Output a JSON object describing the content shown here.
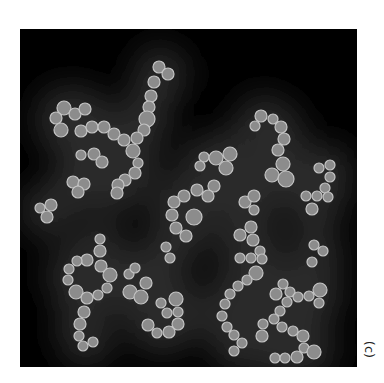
{
  "figure": {
    "panel_label": "(c)",
    "colors": {
      "background": "#000000",
      "haze": "#2a2a2a",
      "particle_fill": "#8c8c8c",
      "particle_rim": "#c4c4c4",
      "page": "#ffffff"
    },
    "panel": {
      "x": 20,
      "y": 29,
      "width": 337,
      "height": 338
    },
    "particles": [
      [
        159,
        67,
        6
      ],
      [
        168,
        74,
        6
      ],
      [
        154,
        82,
        6
      ],
      [
        151,
        96,
        6
      ],
      [
        149,
        107,
        6
      ],
      [
        147,
        119,
        8
      ],
      [
        144,
        130,
        6
      ],
      [
        64,
        108,
        7
      ],
      [
        56,
        118,
        6
      ],
      [
        61,
        130,
        7
      ],
      [
        75,
        114,
        6
      ],
      [
        85,
        109,
        6
      ],
      [
        81,
        131,
        6
      ],
      [
        92,
        127,
        6
      ],
      [
        104,
        127,
        6
      ],
      [
        114,
        134,
        6
      ],
      [
        124,
        140,
        6
      ],
      [
        137,
        138,
        6
      ],
      [
        133,
        151,
        7
      ],
      [
        138,
        163,
        5
      ],
      [
        135,
        173,
        6
      ],
      [
        125,
        180,
        6
      ],
      [
        118,
        185,
        6
      ],
      [
        117,
        193,
        6
      ],
      [
        81,
        155,
        5
      ],
      [
        94,
        154,
        6
      ],
      [
        102,
        162,
        6
      ],
      [
        73,
        182,
        6
      ],
      [
        84,
        184,
        6
      ],
      [
        78,
        192,
        6
      ],
      [
        40,
        208,
        5
      ],
      [
        51,
        205,
        6
      ],
      [
        47,
        217,
        6
      ],
      [
        204,
        157,
        5
      ],
      [
        200,
        166,
        5
      ],
      [
        216,
        158,
        7
      ],
      [
        230,
        154,
        7
      ],
      [
        226,
        168,
        7
      ],
      [
        214,
        186,
        6
      ],
      [
        208,
        196,
        6
      ],
      [
        197,
        190,
        6
      ],
      [
        184,
        196,
        6
      ],
      [
        174,
        202,
        6
      ],
      [
        172,
        215,
        6
      ],
      [
        176,
        228,
        6
      ],
      [
        186,
        236,
        6
      ],
      [
        194,
        217,
        8
      ],
      [
        245,
        202,
        6
      ],
      [
        254,
        196,
        6
      ],
      [
        254,
        210,
        5
      ],
      [
        261,
        116,
        6
      ],
      [
        255,
        126,
        5
      ],
      [
        273,
        119,
        5
      ],
      [
        281,
        127,
        6
      ],
      [
        284,
        139,
        6
      ],
      [
        278,
        150,
        6
      ],
      [
        283,
        164,
        7
      ],
      [
        272,
        175,
        7
      ],
      [
        286,
        179,
        8
      ],
      [
        319,
        168,
        5
      ],
      [
        330,
        165,
        5
      ],
      [
        330,
        177,
        5
      ],
      [
        325,
        188,
        5
      ],
      [
        317,
        196,
        5
      ],
      [
        306,
        196,
        5
      ],
      [
        328,
        197,
        5
      ],
      [
        312,
        209,
        6
      ],
      [
        314,
        245,
        5
      ],
      [
        323,
        251,
        5
      ],
      [
        100,
        239,
        5
      ],
      [
        100,
        251,
        6
      ],
      [
        87,
        260,
        6
      ],
      [
        77,
        261,
        5
      ],
      [
        69,
        269,
        5
      ],
      [
        101,
        266,
        6
      ],
      [
        110,
        275,
        7
      ],
      [
        68,
        280,
        5
      ],
      [
        76,
        292,
        7
      ],
      [
        87,
        298,
        6
      ],
      [
        98,
        295,
        5
      ],
      [
        107,
        288,
        5
      ],
      [
        84,
        312,
        6
      ],
      [
        80,
        324,
        6
      ],
      [
        79,
        336,
        5
      ],
      [
        83,
        346,
        5
      ],
      [
        93,
        342,
        5
      ],
      [
        129,
        274,
        5
      ],
      [
        135,
        268,
        5
      ],
      [
        146,
        283,
        6
      ],
      [
        130,
        292,
        7
      ],
      [
        141,
        297,
        7
      ],
      [
        166,
        247,
        5
      ],
      [
        170,
        258,
        5
      ],
      [
        161,
        303,
        5
      ],
      [
        167,
        313,
        5
      ],
      [
        176,
        299,
        7
      ],
      [
        178,
        312,
        5
      ],
      [
        178,
        324,
        6
      ],
      [
        169,
        332,
        6
      ],
      [
        157,
        333,
        5
      ],
      [
        148,
        325,
        6
      ],
      [
        251,
        227,
        6
      ],
      [
        240,
        235,
        6
      ],
      [
        253,
        240,
        6
      ],
      [
        260,
        251,
        5
      ],
      [
        240,
        258,
        5
      ],
      [
        251,
        258,
        5
      ],
      [
        262,
        259,
        5
      ],
      [
        256,
        273,
        7
      ],
      [
        247,
        280,
        5
      ],
      [
        238,
        286,
        5
      ],
      [
        230,
        294,
        5
      ],
      [
        225,
        304,
        5
      ],
      [
        222,
        316,
        5
      ],
      [
        227,
        327,
        5
      ],
      [
        234,
        335,
        5
      ],
      [
        242,
        343,
        5
      ],
      [
        234,
        351,
        5
      ],
      [
        312,
        262,
        5
      ],
      [
        283,
        284,
        5
      ],
      [
        276,
        294,
        6
      ],
      [
        290,
        292,
        5
      ],
      [
        287,
        302,
        5
      ],
      [
        298,
        297,
        5
      ],
      [
        309,
        296,
        5
      ],
      [
        320,
        290,
        7
      ],
      [
        319,
        303,
        5
      ],
      [
        280,
        311,
        5
      ],
      [
        274,
        319,
        5
      ],
      [
        263,
        324,
        5
      ],
      [
        262,
        336,
        6
      ],
      [
        282,
        327,
        5
      ],
      [
        293,
        331,
        5
      ],
      [
        303,
        336,
        6
      ],
      [
        304,
        348,
        5
      ],
      [
        314,
        352,
        7
      ],
      [
        275,
        358,
        5
      ],
      [
        285,
        358,
        5
      ],
      [
        297,
        357,
        6
      ]
    ]
  }
}
